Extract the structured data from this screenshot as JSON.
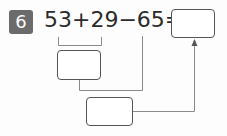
{
  "problem": {
    "number": "6",
    "equation": "53+29−65=",
    "terms": [
      "53",
      "+",
      "29",
      "−",
      "65",
      "="
    ],
    "badge_color": "#6b6b6b"
  },
  "boxes": {
    "answer": "",
    "step1": "",
    "step2": ""
  }
}
